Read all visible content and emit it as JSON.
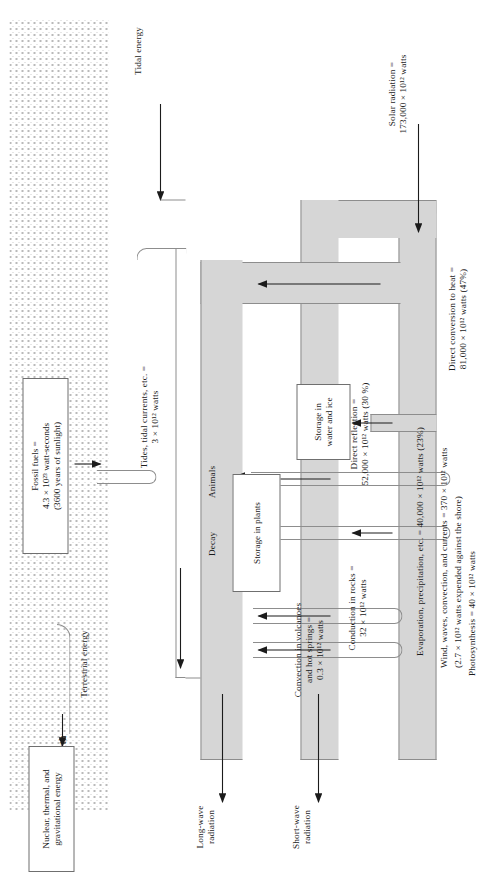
{
  "figure": {
    "type": "energy-flow-sankey-diagram",
    "orientation": "rotated-90-ccw",
    "colors": {
      "band_fill": "#d6d6d6",
      "stroke": "#8d8d8d",
      "earth_stipple": "#c4c4c4",
      "text": "#1b1b1b"
    }
  },
  "inputs": {
    "solar": "Solar radiation =\n173,000 × 10¹² watts",
    "tidal": "Tidal energy",
    "terrestrial": "Terrestrial energy"
  },
  "outputs": {
    "short_wave": "Short-wave\nradiation",
    "long_wave": "Long-wave\nradiation"
  },
  "flows": {
    "direct_reflection": "Direct reflection =\n52,000 × 10¹² watts (30 %)",
    "direct_conversion": "Direct conversion to heat =\n81,000 × 10¹² watts (47%)",
    "evaporation": "Evaporation, precipitation, etc. = 40,000 × 10¹² watts (23%)",
    "wind_waves": "Wind, waves, convection, and currents = 370 × 10¹² watts",
    "wind_waves_note": "(2.7 × 10¹² watts expended against the shore)",
    "photosynthesis": "Photosynthesis = 40 × 10¹² watts",
    "tides": "Tides, tidal currents, etc. =\n3 × 10¹² watts",
    "convection_volcanoes": "Convection in volcanoes\nand hot springs =\n0.3 × 10¹² watts",
    "conduction_rocks": "Conduction in rocks =\n32 × 10¹² watts",
    "decay": "Decay",
    "animals": "Animals"
  },
  "storage_boxes": {
    "water_ice": "Storage in\nwater and ice",
    "plants": "Storage in plants",
    "fossil_fuels": "Fossil fuels =\n4.3 × 10²³ watt-seconds\n(3600 years of sunlight)",
    "nuclear": "Nuclear, thermal, and\ngravitational energy"
  },
  "earth": {
    "label": "Earth"
  }
}
